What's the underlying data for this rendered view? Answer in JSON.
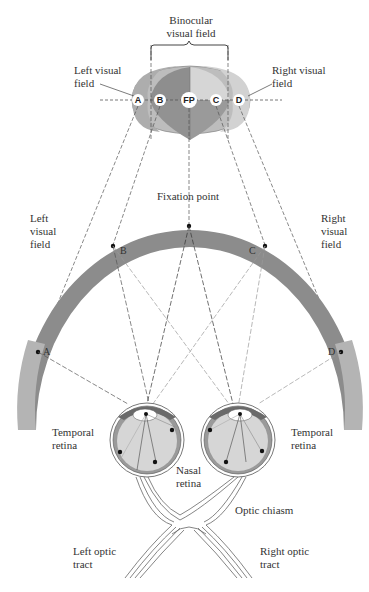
{
  "labels": {
    "binocular": "Binocular\nvisual field",
    "left_visual_field_top": "Left visual\nfield",
    "right_visual_field_top": "Right visual\nfield",
    "fixation_point": "Fixation point",
    "left_visual_field": "Left\nvisual\nfield",
    "right_visual_field": "Right\nvisual\nfield",
    "temporal_retina_left": "Temporal\nretina",
    "temporal_retina_right": "Temporal\nretina",
    "nasal_retina": "Nasal\nretina",
    "optic_chiasm": "Optic chiasm",
    "left_optic_tract": "Left optic\ntract",
    "right_optic_tract": "Right optic\ntract"
  },
  "field_points": {
    "A": "A",
    "B": "B",
    "FP": "FP",
    "C": "C",
    "D": "D"
  },
  "arc_points": {
    "A": "A",
    "B": "B",
    "C": "C",
    "D": "D"
  },
  "colors": {
    "dark_field": "#8a8a8a",
    "mid_field": "#a8a8a8",
    "light_field": "#c9c9c9",
    "arc_dark": "#8c8c8c",
    "arc_light": "#b4b4b4",
    "eye_inner": "#d6d6d6",
    "line": "#555555"
  }
}
